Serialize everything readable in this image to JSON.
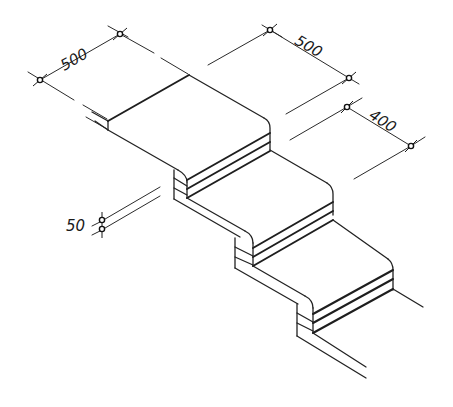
{
  "diagram": {
    "type": "isometric stair detail drawing",
    "background": "#ffffff",
    "line_color": "#222222",
    "dimensions": [
      {
        "id": "tread-width",
        "label": "500",
        "direction": "along width axis"
      },
      {
        "id": "tread-depth",
        "label": "500",
        "direction": "along depth axis"
      },
      {
        "id": "riser-offset",
        "label": "400",
        "direction": "along depth axis"
      },
      {
        "id": "layer-thickness",
        "label": "50",
        "direction": "vertical"
      }
    ],
    "steps": [
      {
        "id": "step-1",
        "layers": 3
      },
      {
        "id": "step-2",
        "layers": 3
      },
      {
        "id": "step-3",
        "layers": 3
      }
    ]
  }
}
